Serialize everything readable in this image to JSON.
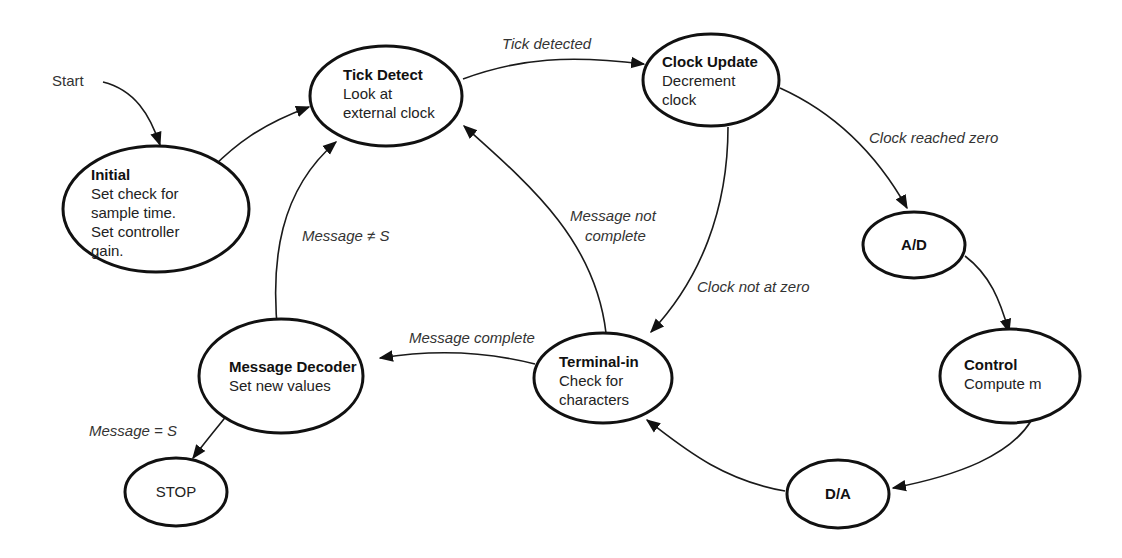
{
  "diagram": {
    "type": "state-transition",
    "start_label": "Start",
    "nodes": {
      "initial": {
        "title": "Initial",
        "lines": [
          "Set check for",
          "sample time.",
          "Set controller",
          "gain."
        ]
      },
      "tick_detect": {
        "title": "Tick Detect",
        "lines": [
          "Look at",
          "external clock"
        ]
      },
      "clock_update": {
        "title": "Clock Update",
        "lines": [
          "Decrement",
          "clock"
        ]
      },
      "ad": {
        "title": "A/D",
        "lines": []
      },
      "control": {
        "title": "Control",
        "lines": [
          "Compute m"
        ]
      },
      "da": {
        "title": "D/A",
        "lines": []
      },
      "terminal_in": {
        "title": "Terminal-in",
        "lines": [
          "Check for",
          "characters"
        ]
      },
      "message_decoder": {
        "title": "Message Decoder",
        "lines": [
          "Set new values"
        ]
      },
      "stop": {
        "title": "STOP",
        "lines": []
      }
    },
    "edges": [
      {
        "from": "start",
        "to": "initial",
        "label": ""
      },
      {
        "from": "initial",
        "to": "tick_detect",
        "label": ""
      },
      {
        "from": "tick_detect",
        "to": "clock_update",
        "label": "Tick detected"
      },
      {
        "from": "clock_update",
        "to": "ad",
        "label": "Clock reached zero"
      },
      {
        "from": "clock_update",
        "to": "terminal_in",
        "label": "Clock not at zero"
      },
      {
        "from": "ad",
        "to": "control",
        "label": ""
      },
      {
        "from": "control",
        "to": "da",
        "label": ""
      },
      {
        "from": "da",
        "to": "terminal_in",
        "label": ""
      },
      {
        "from": "terminal_in",
        "to": "tick_detect",
        "label": "Message not complete"
      },
      {
        "from": "terminal_in",
        "to": "message_decoder",
        "label": "Message complete"
      },
      {
        "from": "message_decoder",
        "to": "tick_detect",
        "label": "Message ≠ S"
      },
      {
        "from": "message_decoder",
        "to": "stop",
        "label": "Message = S"
      }
    ],
    "labels": {
      "tick_detected": "Tick detected",
      "clock_reached_zero": "Clock reached zero",
      "clock_not_at_zero": "Clock not at zero",
      "message_not_complete_1": "Message not",
      "message_not_complete_2": "complete",
      "message_complete": "Message complete",
      "message_not_s": "Message ≠ S",
      "message_eq_s": "Message = S"
    }
  }
}
